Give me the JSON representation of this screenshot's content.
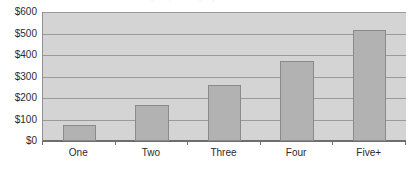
{
  "chart_data": {
    "type": "bar",
    "title": "",
    "xlabel": "",
    "ylabel": "",
    "categories": [
      "One",
      "Two",
      "Three",
      "Four",
      "Five+"
    ],
    "values": [
      74,
      167,
      260,
      372,
      516
    ],
    "ylim": [
      0,
      600
    ],
    "ytick_values": [
      0,
      100,
      200,
      300,
      400,
      500,
      600
    ],
    "ytick_labels": [
      "$0",
      "$100",
      "$200",
      "$300",
      "$400",
      "$500",
      "$600"
    ],
    "grid": true,
    "legend": "none",
    "series": [
      {
        "name": "Amount",
        "values": [
          74,
          167,
          260,
          372,
          516
        ]
      }
    ],
    "colors": {
      "bar_fill": "#b2b2b2",
      "bar_border": "#8a8a8a",
      "plot_background": "#d4d4d4",
      "gridline": "#9a9a9a",
      "axis_line": "#6e6e6e",
      "tick_label": "#2b2b2b",
      "page_background": "#ffffff"
    }
  },
  "title_sliver": {
    "text": "Average Spending by Household Size"
  }
}
